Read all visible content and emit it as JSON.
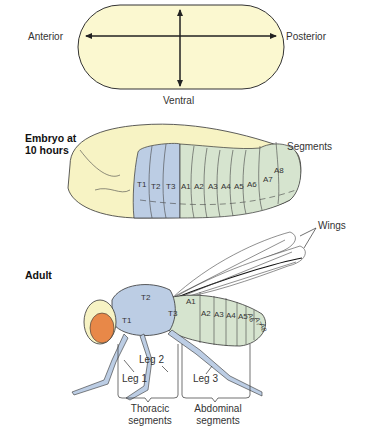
{
  "axes_diagram": {
    "anterior": "Anterior",
    "posterior": "Posterior",
    "ventral": "Ventral"
  },
  "embryo": {
    "title_line1": "Embryo at",
    "title_line2": "10 hours",
    "segments_label": "Segments",
    "thoracic": [
      "T1",
      "T2",
      "T3"
    ],
    "abdominal": [
      "A1",
      "A2",
      "A3",
      "A4",
      "A5",
      "A6",
      "A7",
      "A8"
    ]
  },
  "adult": {
    "title": "Adult",
    "wings_label": "Wings",
    "thoracic": [
      "T1",
      "T2",
      "T3"
    ],
    "abdominal": [
      "A1",
      "A2",
      "A3",
      "A4",
      "A5",
      "A6",
      "A7",
      "A8"
    ],
    "legs": [
      "Leg 1",
      "Leg 2",
      "Leg 3"
    ],
    "thoracic_group_line1": "Thoracic",
    "thoracic_group_line2": "segments",
    "abdominal_group_line1": "Abdominal",
    "abdominal_group_line2": "segments"
  },
  "colors": {
    "head_yellow": "#f7f3c4",
    "thorax_blue": "#bccde4",
    "abdomen_green": "#d6e4cf",
    "eye_orange": "#e88848",
    "outline": "#333333"
  }
}
